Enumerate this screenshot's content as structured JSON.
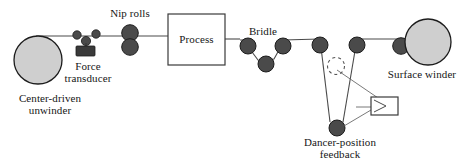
{
  "figure": {
    "type": "process-flow-diagram",
    "colors": {
      "web_line": "#4a4a4a",
      "roller_fill": "#4a4a4a",
      "roller_stroke": "#1c1c1c",
      "roll_fill": "#cfcfcf",
      "roll_stroke": "#1c1c1c",
      "box_stroke": "#3a3a3a",
      "box_fill": "#ffffff",
      "transducer_fill": "#3a3a3a",
      "dashed_stroke": "#555555",
      "text": "#161616"
    }
  },
  "labels": {
    "unwinder": "Center-driven\nunwinder",
    "force_transducer": "Force\ntransducer",
    "nip_rolls": "Nip rolls",
    "process": "Process",
    "bridle": "Bridle",
    "dancer_feedback": "Dancer-position\nfeedback",
    "surface_winder": "Surface winder"
  },
  "components": {
    "unwinder_roll": {
      "cx": 38,
      "cy": 60,
      "r": 24
    },
    "surface_winder_roll": {
      "cx": 428,
      "cy": 42,
      "r": 23
    },
    "process_box": {
      "x": 168,
      "y": 14,
      "w": 57,
      "h": 50
    },
    "feedback_box": {
      "x": 371,
      "y": 97,
      "w": 26,
      "h": 18
    },
    "transducer_block": {
      "x": 75,
      "y": 45,
      "w": 16,
      "h": 10
    },
    "dancer_travel_circle": {
      "cx": 336,
      "cy": 66,
      "r": 9,
      "dashed": true
    },
    "idler_rollers": [
      {
        "name": "idler-1",
        "cx": 77,
        "cy": 35,
        "r": 4
      },
      {
        "name": "idler-2",
        "cx": 96,
        "cy": 34,
        "r": 4
      },
      {
        "name": "force-transducer-roller",
        "cx": 86,
        "cy": 41,
        "r": 4.5
      },
      {
        "name": "nip-roll-upper",
        "cx": 130,
        "cy": 33,
        "r": 8
      },
      {
        "name": "nip-roll-lower",
        "cx": 130,
        "cy": 47,
        "r": 8
      },
      {
        "name": "bridle-roller-left",
        "cx": 248,
        "cy": 46,
        "r": 8
      },
      {
        "name": "bridle-roller-bottom",
        "cx": 266,
        "cy": 63,
        "r": 8
      },
      {
        "name": "bridle-roller-right",
        "cx": 283,
        "cy": 46,
        "r": 8
      },
      {
        "name": "idler-pre-dancer",
        "cx": 320,
        "cy": 45,
        "r": 8
      },
      {
        "name": "dancer-roller",
        "cx": 336,
        "cy": 128,
        "r": 8
      },
      {
        "name": "idler-post-dancer",
        "cx": 357,
        "cy": 45,
        "r": 8
      },
      {
        "name": "winder-nip-roller",
        "cx": 401,
        "cy": 46,
        "r": 8
      }
    ],
    "web_path": "M 38 36 L 130 36 L 168 36 M 225 36 L 248 40 L 266 55 L 283 40 L 320 39 L 330 122 L 344 122 L 357 39 L 401 40 L 405 42"
  }
}
